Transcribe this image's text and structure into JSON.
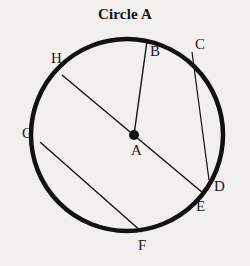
{
  "figure": {
    "title": "Circle A",
    "background_color": "#f1f0ee",
    "stroke_color": "#111111",
    "width": 250,
    "height": 266
  },
  "chart_data": {
    "type": "diagram",
    "title": "Circle A",
    "shape": "circle",
    "circle": {
      "center_label": "A",
      "center": [
        127,
        135
      ],
      "radius": 96,
      "stroke_width": 4.5
    },
    "points": [
      {
        "label": "A",
        "role": "center",
        "x": 134,
        "y": 135,
        "label_x": 131,
        "label_y": 143
      },
      {
        "label": "B",
        "role": "on-circle",
        "x": 147,
        "y": 41,
        "label_x": 150,
        "label_y": 44
      },
      {
        "label": "C",
        "role": "on-circle",
        "x": 192,
        "y": 52,
        "label_x": 195,
        "label_y": 37
      },
      {
        "label": "D",
        "role": "on-circle",
        "x": 209,
        "y": 180,
        "label_x": 214,
        "label_y": 179
      },
      {
        "label": "E",
        "role": "on-circle",
        "x": 203,
        "y": 193,
        "label_x": 196,
        "label_y": 199
      },
      {
        "label": "F",
        "role": "on-circle",
        "x": 142,
        "y": 232,
        "label_x": 138,
        "label_y": 238
      },
      {
        "label": "G",
        "role": "on-circle",
        "x": 40,
        "y": 142,
        "label_x": 22,
        "label_y": 126
      },
      {
        "label": "H",
        "role": "on-circle",
        "x": 62,
        "y": 75,
        "label_x": 51,
        "label_y": 51
      }
    ],
    "segments": [
      {
        "name": "radius-AB",
        "from": "A",
        "to": "B",
        "kind": "radius",
        "x1": 134,
        "y1": 135,
        "x2": 147,
        "y2": 41,
        "stroke_width": 1.4
      },
      {
        "name": "chord-HE",
        "from": "H",
        "to": "E",
        "kind": "chord",
        "x1": 62,
        "y1": 75,
        "x2": 203,
        "y2": 193,
        "stroke_width": 1.4
      },
      {
        "name": "chord-CD",
        "from": "C",
        "to": "D",
        "kind": "chord",
        "x1": 192,
        "y1": 52,
        "x2": 209,
        "y2": 180,
        "stroke_width": 1.2
      },
      {
        "name": "chord-GF",
        "from": "G",
        "to": "F",
        "kind": "chord",
        "x1": 40,
        "y1": 142,
        "x2": 142,
        "y2": 232,
        "stroke_width": 1.4
      }
    ],
    "labels": [
      "A",
      "B",
      "C",
      "D",
      "E",
      "F",
      "G",
      "H"
    ]
  }
}
